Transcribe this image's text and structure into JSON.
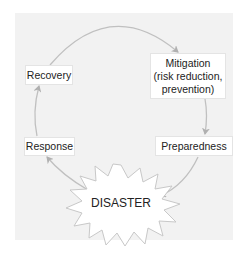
{
  "diagram": {
    "stages": [
      {
        "id": "mitigation",
        "label_lines": [
          "Mitigation",
          "(risk reduction,",
          "prevention)"
        ]
      },
      {
        "id": "preparedness",
        "label": "Preparedness"
      },
      {
        "id": "disaster",
        "label": "DISASTER"
      },
      {
        "id": "response",
        "label": "Response"
      },
      {
        "id": "recovery",
        "label": "Recovery"
      }
    ],
    "flow": [
      "Recovery",
      "Mitigation (risk reduction, prevention)",
      "Preparedness",
      "DISASTER",
      "Response",
      "Recovery"
    ],
    "colors": {
      "panel": "#f2f2f2",
      "box": "#ffffff",
      "arrow": "#b8b8b8",
      "text": "#222222"
    }
  }
}
